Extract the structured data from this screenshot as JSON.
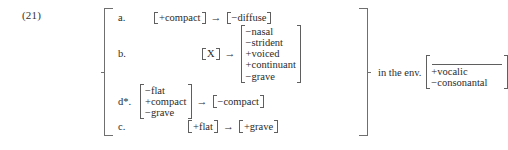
{
  "example": {
    "number": "(21)"
  },
  "rules": [
    {
      "label": "a.",
      "input": {
        "features": [
          "+compact"
        ]
      },
      "arrow": "→",
      "output": {
        "features": [
          "−diffuse"
        ]
      }
    },
    {
      "label": "b.",
      "input": {
        "features": [
          "X"
        ]
      },
      "arrow": "→",
      "output": {
        "features": [
          "−nasal",
          "−strident",
          "+voiced",
          "+continuant",
          "−grave"
        ]
      }
    },
    {
      "label": "d*.",
      "input": {
        "features": [
          "−flat",
          "+compact",
          "−grave"
        ]
      },
      "arrow": "→",
      "output": {
        "features": [
          "−compact"
        ]
      }
    },
    {
      "label": "c.",
      "input": {
        "features": [
          "+flat"
        ]
      },
      "arrow": "→",
      "output": {
        "features": [
          "+grave"
        ]
      }
    }
  ],
  "environment": {
    "text": "in the env.",
    "slot": "___________",
    "features": [
      "+vocalic",
      "−consonantal"
    ]
  },
  "colors": {
    "background": "#ffffff",
    "text": "#2b2b2b",
    "rule_line": "#5f5f5f",
    "brace_line": "#6f6f6f"
  }
}
